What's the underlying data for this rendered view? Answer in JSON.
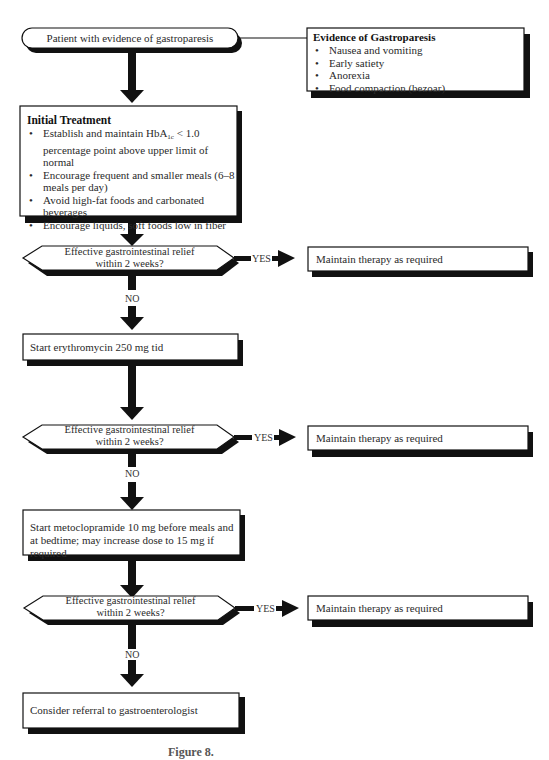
{
  "flowchart": {
    "start": {
      "label": "Patient with evidence of gastroparesis"
    },
    "evidence_box": {
      "title": "Evidence of Gastroparesis",
      "items": [
        "Nausea and vomiting",
        "Early satiety",
        "Anorexia",
        "Food compaction (bezoar)"
      ]
    },
    "initial_treatment": {
      "title": "Initial Treatment",
      "items": [
        {
          "pre": "Establish and maintain HbA",
          "sub": "1c",
          "post": " < 1.0 percentage point above upper limit of normal"
        },
        {
          "text": "Encourage frequent and smaller meals (6–8 meals per day)"
        },
        {
          "text": "Avoid high-fat foods and carbonated beverages"
        },
        {
          "text": "Encourage liquids, soft foods low in fiber"
        }
      ]
    },
    "decisions": [
      {
        "question_line1": "Effective gastrointestinal relief",
        "question_line2": "within 2 weeks?",
        "yes_label": "YES",
        "no_label": "NO",
        "yes_outcome": "Maintain therapy as required"
      },
      {
        "question_line1": "Effective gastrointestinal relief",
        "question_line2": "within 2 weeks?",
        "yes_label": "YES",
        "no_label": "NO",
        "yes_outcome": "Maintain therapy as required"
      },
      {
        "question_line1": "Effective gastrointestinal relief",
        "question_line2": "within 2 weeks?",
        "yes_label": "YES",
        "no_label": "NO",
        "yes_outcome": "Maintain therapy as required"
      }
    ],
    "steps": [
      {
        "label": "Start erythromycin 250 mg tid"
      },
      {
        "label": "Start metoclopramide 10 mg before meals and at bedtime; may increase dose to 15 mg if required"
      },
      {
        "label": "Consider referral to gastroenterologist"
      }
    ],
    "caption": "Figure 8.",
    "colors": {
      "line": "#111111",
      "shadow": "#111111",
      "box_fill": "#ffffff",
      "text": "#2a2a2a"
    }
  }
}
